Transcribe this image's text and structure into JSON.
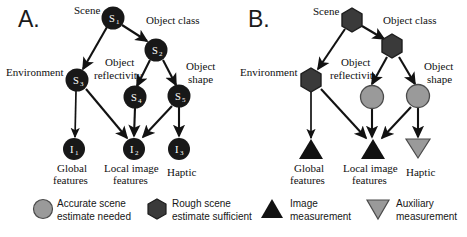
{
  "figure": {
    "background_color": "#ffffff"
  },
  "colors": {
    "dark_node": "#181818",
    "rough_hex": "#3a3a3a",
    "gray_node": "#9a9a9a",
    "gray_node_stroke": "#4a4a4a",
    "edge": "#121212",
    "text": "#101010"
  },
  "panels": [
    {
      "id": "A",
      "letter": "A.",
      "nodes": [
        {
          "key": "S1",
          "id": "S",
          "sub": "1",
          "label": "Scene",
          "label_lines": [
            "Scene"
          ],
          "shape": "circle",
          "fill": "dark"
        },
        {
          "key": "S2",
          "id": "S",
          "sub": "2",
          "label": "Object class",
          "label_lines": [
            "Object class"
          ],
          "shape": "circle",
          "fill": "dark"
        },
        {
          "key": "S3",
          "id": "S",
          "sub": "3",
          "label": "Environment",
          "label_lines": [
            "Environment"
          ],
          "shape": "circle",
          "fill": "dark"
        },
        {
          "key": "S4",
          "id": "S",
          "sub": "4",
          "label": "Object reflectivity",
          "label_lines": [
            "Object",
            "reflectivity"
          ],
          "shape": "circle",
          "fill": "dark"
        },
        {
          "key": "S5",
          "id": "S",
          "sub": "5",
          "label": "Object shape",
          "label_lines": [
            "Object",
            "shape"
          ],
          "shape": "circle",
          "fill": "dark"
        },
        {
          "key": "I1",
          "id": "I",
          "sub": "1",
          "label": "Global features",
          "label_lines": [
            "Global",
            "features"
          ],
          "shape": "circle",
          "fill": "dark"
        },
        {
          "key": "I2",
          "id": "I",
          "sub": "2",
          "label": "Local image features",
          "label_lines": [
            "Local image",
            "features"
          ],
          "shape": "circle",
          "fill": "dark"
        },
        {
          "key": "I3",
          "id": "I",
          "sub": "3",
          "label": "Haptic",
          "label_lines": [
            "Haptic"
          ],
          "shape": "circle",
          "fill": "dark"
        }
      ],
      "edges": [
        {
          "from": "S1",
          "to": "S3"
        },
        {
          "from": "S1",
          "to": "S2"
        },
        {
          "from": "S2",
          "to": "S4"
        },
        {
          "from": "S2",
          "to": "S5"
        },
        {
          "from": "S3",
          "to": "I1"
        },
        {
          "from": "S3",
          "to": "I2"
        },
        {
          "from": "S4",
          "to": "I2"
        },
        {
          "from": "S5",
          "to": "I2"
        },
        {
          "from": "S5",
          "to": "I3"
        }
      ]
    },
    {
      "id": "B",
      "letter": "B.",
      "nodes": [
        {
          "key": "S1",
          "id": "",
          "sub": "",
          "label": "Scene",
          "label_lines": [
            "Scene"
          ],
          "shape": "hexagon",
          "fill": "rough"
        },
        {
          "key": "S2",
          "id": "",
          "sub": "",
          "label": "Object class",
          "label_lines": [
            "Object class"
          ],
          "shape": "hexagon",
          "fill": "rough"
        },
        {
          "key": "S3",
          "id": "",
          "sub": "",
          "label": "Environment",
          "label_lines": [
            "Environment"
          ],
          "shape": "hexagon",
          "fill": "rough"
        },
        {
          "key": "S4",
          "id": "",
          "sub": "",
          "label": "Object reflectivity",
          "label_lines": [
            "Object",
            "reflectivity"
          ],
          "shape": "circle",
          "fill": "gray"
        },
        {
          "key": "S5",
          "id": "",
          "sub": "",
          "label": "Object shape",
          "label_lines": [
            "Object",
            "shape"
          ],
          "shape": "circle",
          "fill": "gray"
        },
        {
          "key": "I1",
          "id": "",
          "sub": "",
          "label": "Global features",
          "label_lines": [
            "Global",
            "features"
          ],
          "shape": "triangle-up",
          "fill": "dark"
        },
        {
          "key": "I2",
          "id": "",
          "sub": "",
          "label": "Local image features",
          "label_lines": [
            "Local image",
            "features"
          ],
          "shape": "triangle-up",
          "fill": "dark"
        },
        {
          "key": "I3",
          "id": "",
          "sub": "",
          "label": "Haptic",
          "label_lines": [
            "Haptic"
          ],
          "shape": "triangle-down",
          "fill": "gray"
        }
      ],
      "edges": [
        {
          "from": "S1",
          "to": "S3"
        },
        {
          "from": "S1",
          "to": "S2"
        },
        {
          "from": "S2",
          "to": "S4"
        },
        {
          "from": "S2",
          "to": "S5"
        },
        {
          "from": "S3",
          "to": "I1"
        },
        {
          "from": "S3",
          "to": "I2"
        },
        {
          "from": "S4",
          "to": "I2"
        },
        {
          "from": "S5",
          "to": "I2"
        },
        {
          "from": "S5",
          "to": "I3"
        }
      ]
    }
  ],
  "legend": {
    "items": [
      {
        "key": "accurate-scene",
        "icon": "circle-gray-icon",
        "shape": "circle",
        "fill": "gray",
        "lines": [
          "Accurate scene",
          "estimate needed"
        ],
        "text": "Accurate scene estimate needed"
      },
      {
        "key": "rough-scene",
        "icon": "hexagon-dark-icon",
        "shape": "hexagon",
        "fill": "rough",
        "lines": [
          "Rough scene",
          "estimate sufficient"
        ],
        "text": "Rough scene estimate sufficient"
      },
      {
        "key": "image-measurement",
        "icon": "triangle-up-dark-icon",
        "shape": "triangle-up",
        "fill": "dark",
        "lines": [
          "Image",
          "measurement"
        ],
        "text": "Image measurement"
      },
      {
        "key": "auxiliary-measurement",
        "icon": "triangle-down-gray-icon",
        "shape": "triangle-down",
        "fill": "gray",
        "lines": [
          "Auxiliary",
          "measurement"
        ],
        "text": "Auxiliary measurement"
      }
    ]
  },
  "panel_a_text": {
    "letter": "A.",
    "scene": "Scene",
    "object_class": "Object class",
    "environment": "Environment",
    "object_l1": "Object",
    "reflectivity_l2": "reflectivity",
    "object_shape_l1": "Object",
    "object_shape_l2": "shape",
    "global_l1": "Global",
    "global_l2": "features",
    "local_l1": "Local image",
    "local_l2": "features",
    "haptic": "Haptic",
    "s1": "S",
    "s1sub": "1",
    "s2": "S",
    "s2sub": "2",
    "s3": "S",
    "s3sub": "3",
    "s4": "S",
    "s4sub": "4",
    "s5": "S",
    "s5sub": "5",
    "i1": "I",
    "i1sub": "1",
    "i2": "I",
    "i2sub": "2",
    "i3": "I",
    "i3sub": "3"
  },
  "panel_b_text": {
    "letter": "B.",
    "scene": "Scene",
    "object_class": "Object class",
    "environment": "Environment",
    "object_l1": "Object",
    "reflectivity_l2": "reflectivity",
    "object_shape_l1": "Object",
    "object_shape_l2": "shape",
    "global_l1": "Global",
    "global_l2": "features",
    "local_l1": "Local image",
    "local_l2": "features",
    "haptic": "Haptic"
  },
  "legend_text": {
    "i1_l1": "Accurate scene",
    "i1_l2": "estimate needed",
    "i2_l1": "Rough scene",
    "i2_l2": "estimate sufficient",
    "i3_l1": "Image",
    "i3_l2": "measurement",
    "i4_l1": "Auxiliary",
    "i4_l2": "measurement"
  }
}
